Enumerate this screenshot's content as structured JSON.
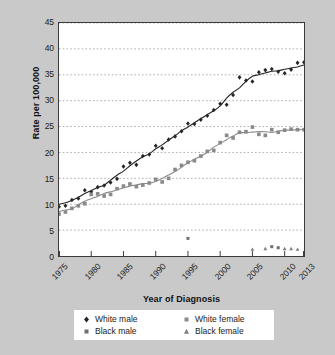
{
  "chart_data": {
    "type": "scatter",
    "title": "",
    "xlabel": "Year of Diagnosis",
    "ylabel": "Rate per 100,000",
    "xlim": [
      1975,
      2013
    ],
    "ylim": [
      0,
      45
    ],
    "ytick_step": 5,
    "grid": "horizontal-dotted",
    "legend_position": "bottom",
    "xticks": [
      "1975",
      "1980",
      "1985",
      "1990",
      "1995",
      "2000",
      "2005",
      "2010",
      "2013"
    ],
    "xtick_values": [
      1975,
      1980,
      1985,
      1990,
      1995,
      2000,
      2005,
      2010,
      2013
    ],
    "yticks": [
      "0",
      "5",
      "10",
      "15",
      "20",
      "25",
      "30",
      "35",
      "40",
      "45"
    ],
    "ytick_values": [
      0,
      5,
      10,
      15,
      20,
      25,
      30,
      35,
      40,
      45
    ],
    "series": [
      {
        "name": "White male",
        "marker": "diamond",
        "color": "#262626",
        "trendline": true,
        "x": [
          1975,
          1976,
          1977,
          1978,
          1979,
          1980,
          1981,
          1982,
          1983,
          1984,
          1985,
          1986,
          1987,
          1988,
          1989,
          1990,
          1991,
          1992,
          1993,
          1994,
          1995,
          1996,
          1997,
          1998,
          1999,
          2000,
          2001,
          2002,
          2003,
          2004,
          2005,
          2006,
          2007,
          2008,
          2009,
          2010,
          2011,
          2012,
          2013
        ],
        "values": [
          9.5,
          9.7,
          10.8,
          11.1,
          12.7,
          12.4,
          13.3,
          13.6,
          14.2,
          14.9,
          17.3,
          18.0,
          17.6,
          19.3,
          19.6,
          21.3,
          20.8,
          22.5,
          23.1,
          24.1,
          25.6,
          25.5,
          26.3,
          27.1,
          28.2,
          29.4,
          29.2,
          31.1,
          34.5,
          33.9,
          33.7,
          35.5,
          35.9,
          36.1,
          35.6,
          35.3,
          36.0,
          37.3,
          37.4
        ]
      },
      {
        "name": "White female",
        "marker": "square",
        "color": "#8a8a8a",
        "trendline": true,
        "x": [
          1975,
          1976,
          1977,
          1978,
          1979,
          1980,
          1981,
          1982,
          1983,
          1984,
          1985,
          1986,
          1987,
          1988,
          1989,
          1990,
          1991,
          1992,
          1993,
          1994,
          1995,
          1996,
          1997,
          1998,
          1999,
          2000,
          2001,
          2002,
          2003,
          2004,
          2005,
          2006,
          2007,
          2008,
          2009,
          2010,
          2011,
          2012,
          2013
        ],
        "values": [
          8.1,
          8.5,
          9.2,
          9.7,
          10.1,
          11.9,
          12.0,
          11.6,
          11.9,
          13.0,
          13.5,
          13.9,
          13.4,
          13.7,
          14.1,
          14.8,
          14.3,
          15.0,
          16.7,
          17.5,
          18.1,
          18.4,
          19.3,
          20.2,
          20.4,
          21.9,
          23.3,
          22.8,
          23.9,
          24.0,
          24.9,
          23.5,
          23.3,
          24.4,
          23.9,
          24.3,
          24.5,
          24.4,
          24.4
        ]
      },
      {
        "name": "Black male",
        "marker": "square",
        "color": "#6f6f6f",
        "trendline": false,
        "x": [
          1995,
          2008,
          2009
        ],
        "values": [
          3.4,
          1.8,
          1.6
        ]
      },
      {
        "name": "Black female",
        "marker": "triangle",
        "color": "#7d7d7d",
        "trendline": false,
        "x": [
          2005,
          2007,
          2010,
          2011,
          2012
        ],
        "values": [
          1.3,
          1.4,
          1.4,
          1.4,
          1.3
        ]
      }
    ]
  },
  "legend": {
    "entries": [
      {
        "label": "White male",
        "marker": "diamond"
      },
      {
        "label": "White female",
        "marker": "square"
      },
      {
        "label": "Black male",
        "marker": "square"
      },
      {
        "label": "Black female",
        "marker": "triangle"
      }
    ]
  },
  "colors": {
    "background": "#c9c9c9",
    "plot_background": "#ffffff",
    "axis": "#3a3a3a",
    "grid": "#9a9a9a",
    "white_male": "#262626",
    "white_female": "#8a8a8a",
    "black_male": "#6f6f6f",
    "black_female": "#7d7d7d"
  }
}
